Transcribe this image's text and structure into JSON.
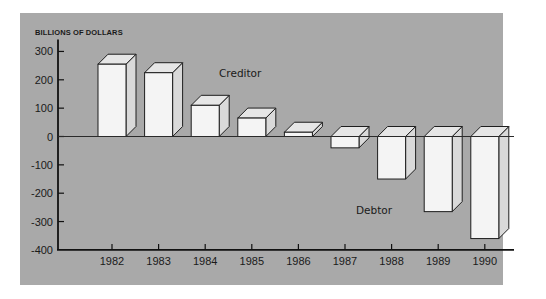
{
  "chart_data": {
    "type": "bar",
    "style": "3d-column",
    "title": "",
    "xlabel": "",
    "ylabel": "BILLIONS OF DOLLARS",
    "categories": [
      "1982",
      "1983",
      "1984",
      "1985",
      "1986",
      "1987",
      "1988",
      "1989",
      "1990"
    ],
    "values": [
      255,
      225,
      110,
      65,
      15,
      -40,
      -150,
      -265,
      -360
    ],
    "ylim": [
      -400,
      300
    ],
    "yticks": [
      300,
      200,
      100,
      0,
      -100,
      -200,
      -300,
      -400
    ],
    "grid": false,
    "legend": null,
    "annotations": [
      {
        "text": "Creditor",
        "region": "positive"
      },
      {
        "text": "Debtor",
        "region": "negative"
      }
    ]
  },
  "colors": {
    "panel_background": "#a9a9a9",
    "bar_front": "#f4f4f4",
    "bar_top": "#e6e6e6",
    "bar_side": "#d9d9d9",
    "outline": "#1e1e1e",
    "axis": "#111111"
  }
}
